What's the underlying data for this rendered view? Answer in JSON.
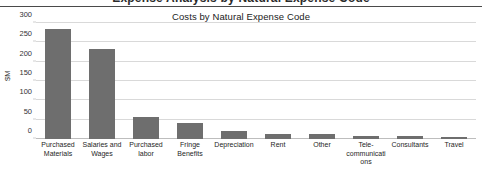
{
  "top_band": {
    "clipped_text": "Expense Analysis by Natural Expense Code"
  },
  "chart_data": {
    "type": "bar",
    "title": "Costs by Natural Expense Code",
    "xlabel": "",
    "ylabel": "$M",
    "ylim": [
      0,
      300
    ],
    "yticks": [
      300,
      250,
      200,
      150,
      100,
      50,
      0
    ],
    "grid": "horizontal",
    "legend": "none",
    "bar_color": "#6e6e6e",
    "categories": [
      "Purchased Materials",
      "Salaries and Wages",
      "Purchased labor",
      "Fringe Benefits",
      "Depreciation",
      "Rent",
      "Other",
      "Tele-communications",
      "Consultants",
      "Travel"
    ],
    "values": [
      285,
      232,
      57,
      42,
      20,
      13,
      12,
      8,
      8,
      6
    ]
  }
}
